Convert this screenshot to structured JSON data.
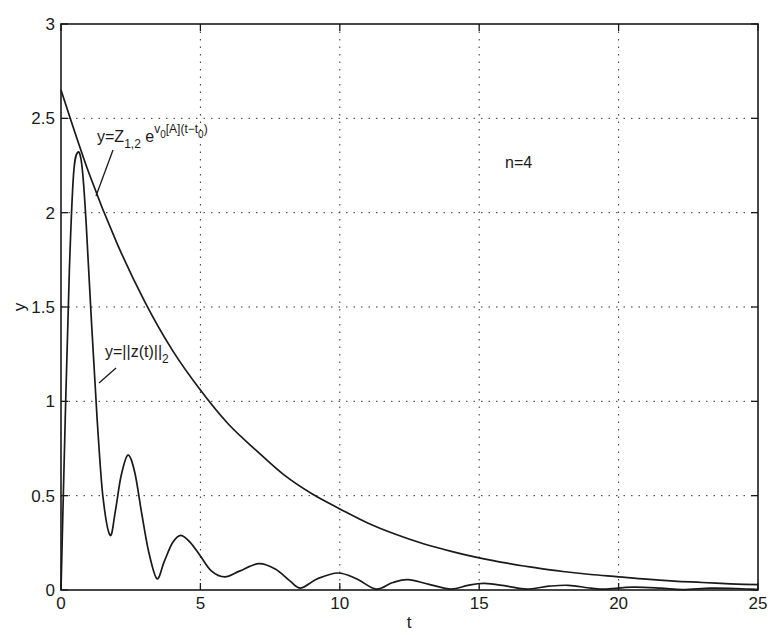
{
  "chart_data": {
    "type": "line",
    "title": "",
    "xlabel": "t",
    "ylabel": "y",
    "xlim": [
      0,
      25
    ],
    "ylim": [
      0,
      3
    ],
    "grid": true,
    "xticks": [
      0,
      5,
      10,
      15,
      20,
      25
    ],
    "xtick_labels": [
      "0",
      "5",
      "10",
      "15",
      "20",
      "25"
    ],
    "yticks": [
      0,
      0.5,
      1,
      1.5,
      2,
      2.5,
      3
    ],
    "ytick_labels": [
      "0",
      "0.5",
      "1",
      "1.5",
      "2",
      "2.5",
      "3"
    ],
    "series": [
      {
        "name": "y=||z(t)||_2",
        "x": [
          0,
          0.15,
          0.3,
          0.45,
          0.6,
          0.75,
          0.9,
          1.1,
          1.3,
          1.5,
          1.76,
          1.95,
          2.15,
          2.4,
          2.65,
          2.9,
          3.15,
          3.44,
          3.7,
          4.0,
          4.3,
          4.65,
          5.0,
          5.4,
          5.88,
          6.4,
          7.1,
          7.7,
          8.2,
          8.6,
          9.2,
          9.94,
          10.6,
          11.3,
          11.9,
          12.45,
          13.2,
          14.0,
          14.6,
          15.2,
          16.0,
          16.7,
          17.5,
          18.2,
          19.0,
          19.5,
          20.5,
          21.5,
          22.3,
          23.3,
          24.2,
          25
        ],
        "values": [
          0,
          0.9,
          1.7,
          2.2,
          2.32,
          2.25,
          1.95,
          1.4,
          0.9,
          0.5,
          0.29,
          0.42,
          0.6,
          0.715,
          0.62,
          0.4,
          0.2,
          0.06,
          0.15,
          0.25,
          0.29,
          0.25,
          0.18,
          0.1,
          0.07,
          0.1,
          0.14,
          0.11,
          0.05,
          0.01,
          0.06,
          0.09,
          0.06,
          0.005,
          0.04,
          0.055,
          0.03,
          0.005,
          0.025,
          0.035,
          0.02,
          0.005,
          0.02,
          0.025,
          0.01,
          0.005,
          0.015,
          0.01,
          0.002,
          0.01,
          0.008,
          0.003
        ]
      },
      {
        "name": "y=Z_{1,2} e^{v_0[A](t-t_0)}",
        "x": [
          0,
          1,
          2,
          3,
          4,
          5,
          6,
          7,
          8,
          9,
          10,
          11,
          12,
          13,
          14,
          15,
          16,
          17,
          18,
          19,
          20,
          21,
          22,
          23,
          24,
          25
        ],
        "values": [
          2.65,
          2.21,
          1.84,
          1.53,
          1.27,
          1.06,
          0.88,
          0.74,
          0.61,
          0.51,
          0.43,
          0.355,
          0.295,
          0.245,
          0.205,
          0.17,
          0.142,
          0.118,
          0.098,
          0.082,
          0.07,
          0.057,
          0.047,
          0.04,
          0.033,
          0.028
        ]
      }
    ],
    "annotations": [
      {
        "text": "n=4",
        "x": 16.0,
        "y": 2.28
      },
      {
        "text": "y=Z_{1,2} e^{v_0[A](t-t_0)}",
        "x": 1.3,
        "y": 2.38
      },
      {
        "text": "y=||z(t)||_2",
        "x": 1.6,
        "y": 1.23
      }
    ],
    "legend": null
  },
  "labels": {
    "xlabel": "t",
    "ylabel": "y",
    "n_annotation": "n=4",
    "exp_label": {
      "main": "y=Z",
      "sub1": "1,2",
      "mid": " e",
      "sup": "v",
      "supsub": "0",
      "sup2": "[A](t−t",
      "sup2sub": "0",
      "sup3": ")"
    },
    "norm_label": {
      "main": "y=||z(t)||",
      "sub": "2"
    }
  }
}
